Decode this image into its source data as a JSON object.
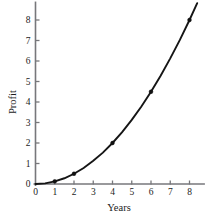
{
  "chart_data": {
    "type": "line",
    "title": "",
    "subtitle": "",
    "xlabel": "Years",
    "ylabel": "Profit",
    "xlim": [
      0,
      8.8
    ],
    "ylim": [
      0,
      8.9
    ],
    "xticks": [
      0,
      1,
      2,
      3,
      4,
      5,
      6,
      7,
      8
    ],
    "yticks": [
      0,
      1,
      2,
      3,
      4,
      5,
      6,
      7,
      8
    ],
    "xtick_labels": [
      "0",
      "1",
      "2",
      "3",
      "4",
      "5",
      "6",
      "7",
      "8"
    ],
    "ytick_labels": [
      "0",
      "1",
      "2",
      "3",
      "4",
      "5",
      "6",
      "7",
      "8"
    ],
    "grid": false,
    "legend": false,
    "legend_position": "none",
    "annotations": [],
    "series": [
      {
        "name": "Profit curve",
        "kind": "curve",
        "relation": "y = x^2 / 8",
        "color": "#151515",
        "x": [
          0,
          0.5,
          1,
          1.5,
          2,
          2.5,
          3,
          3.5,
          4,
          4.5,
          5,
          5.5,
          6,
          6.5,
          7,
          7.5,
          8,
          8.4
        ],
        "y": [
          0,
          0.03,
          0.13,
          0.28,
          0.5,
          0.78,
          1.13,
          1.53,
          2.0,
          2.53,
          3.13,
          3.78,
          4.5,
          5.28,
          6.13,
          7.03,
          8.0,
          8.82
        ]
      },
      {
        "name": "Data points",
        "kind": "markers",
        "color": "#111111",
        "x": [
          1,
          2,
          4,
          6,
          8
        ],
        "y": [
          0.13,
          0.5,
          2.0,
          4.5,
          8.0
        ]
      }
    ]
  },
  "axes": {
    "x_axis_name": "Years",
    "y_axis_name": "Profit"
  }
}
